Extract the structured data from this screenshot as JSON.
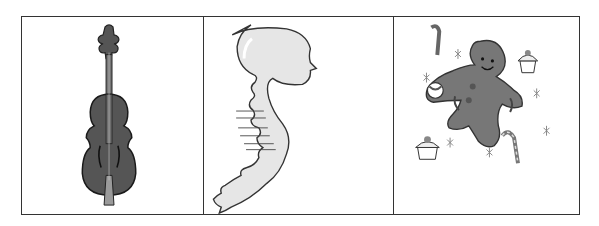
{
  "table": {
    "cells": [
      {
        "picture": "violin",
        "stroke": "#222222",
        "fill": "#555555"
      },
      {
        "picture": "skull-and-spine-silhouette",
        "stroke": "#333333",
        "fill": "#e6e6e6"
      },
      {
        "picture": "gingerbread-man-with-candy",
        "stroke": "#333333",
        "fill": "#777777"
      }
    ]
  }
}
